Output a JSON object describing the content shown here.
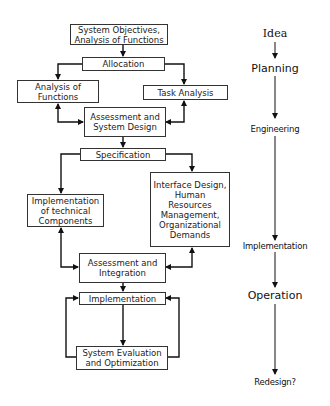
{
  "diagram": {
    "type": "flowchart",
    "boxes": {
      "objectives": "System Objectives,\nAnalysis of Functions",
      "allocation": "Allocation",
      "analysis_functions": "Analysis of\nFunctions",
      "task_analysis": "Task Analysis",
      "assessment_design": "Assessment  and\nSystem Design",
      "specification": "Specification",
      "impl_technical": "Implementation\nof technical\nComponents",
      "interface_design": "Interface Design,\nHuman\nResources\nManagement,\nOrganizational\nDemands",
      "assessment_integration": "Assessment and\nIntegration",
      "implementation": "Implementation",
      "evaluation": "System Evaluation\nand Optimization"
    },
    "phases": [
      {
        "label": "Idea"
      },
      {
        "label": "Planning"
      },
      {
        "label": "Engineering"
      },
      {
        "label": "Implementation"
      },
      {
        "label": "Operation"
      },
      {
        "label": "Redesign?"
      }
    ],
    "edges": [
      {
        "from": "objectives",
        "to": "allocation"
      },
      {
        "from": "allocation",
        "to": "analysis_functions"
      },
      {
        "from": "allocation",
        "to": "task_analysis"
      },
      {
        "from": "analysis_functions",
        "to": "assessment_design",
        "bidirectional": true
      },
      {
        "from": "task_analysis",
        "to": "assessment_design",
        "bidirectional": true
      },
      {
        "from": "assessment_design",
        "to": "specification"
      },
      {
        "from": "specification",
        "to": "impl_technical"
      },
      {
        "from": "specification",
        "to": "interface_design"
      },
      {
        "from": "impl_technical",
        "to": "assessment_integration",
        "bidirectional": true
      },
      {
        "from": "interface_design",
        "to": "assessment_integration",
        "bidirectional": true
      },
      {
        "from": "assessment_integration",
        "to": "implementation"
      },
      {
        "from": "implementation",
        "to": "evaluation"
      },
      {
        "from": "evaluation",
        "to": "implementation",
        "side": "left"
      },
      {
        "from": "evaluation",
        "to": "implementation",
        "side": "right"
      }
    ],
    "colors": {
      "line": "#111111",
      "box_border": "#333333",
      "text": "#222222",
      "background": "#ffffff"
    }
  }
}
